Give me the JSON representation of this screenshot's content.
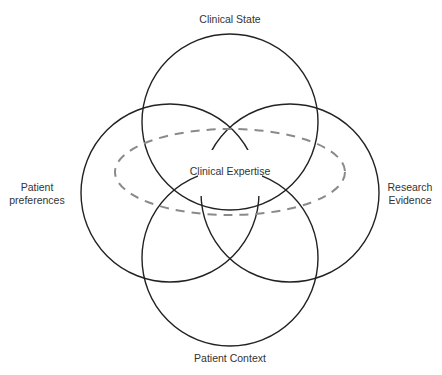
{
  "diagram": {
    "type": "venn",
    "labels": {
      "top": "Clinical State",
      "center": "Clinical Expertise",
      "left_line1": "Patient",
      "left_line2": "preferences",
      "right_line1": "Research",
      "right_line2": "Evidence",
      "bottom": "Patient Context"
    },
    "circles": [
      {
        "name": "Clinical State",
        "cx": 230,
        "cy": 122,
        "r": 88
      },
      {
        "name": "Patient preferences",
        "cx": 170,
        "cy": 193,
        "r": 89
      },
      {
        "name": "Research Evidence",
        "cx": 290,
        "cy": 193,
        "r": 89
      },
      {
        "name": "Patient Context",
        "cx": 230,
        "cy": 258,
        "r": 88
      }
    ],
    "ellipse": {
      "name": "Clinical Expertise",
      "cx": 230,
      "cy": 172,
      "rx": 115,
      "ry": 43,
      "style": "dashed"
    },
    "colors": {
      "circle_stroke": "#222222",
      "ellipse_stroke": "#8a8a8a",
      "text": "#333333",
      "background": "#ffffff"
    }
  }
}
